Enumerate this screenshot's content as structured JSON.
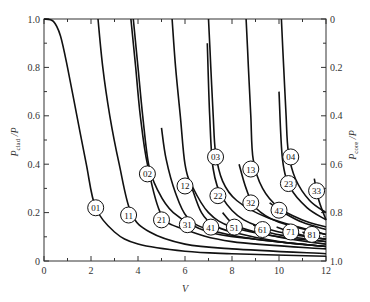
{
  "chart_data": {
    "type": "line",
    "title": "",
    "xlabel": "V",
    "ylabel_left": "P_clad / P",
    "ylabel_right": "P_core / P",
    "xlim": [
      0,
      12
    ],
    "ylim": [
      0,
      1.0
    ],
    "grid": false,
    "legend": "inline circled mode labels",
    "x_ticks": [
      "0",
      "2",
      "4",
      "6",
      "8",
      "10",
      "12"
    ],
    "y_ticks_left": [
      "0",
      "0.2",
      "0.4",
      "0.6",
      "0.8",
      "1.0"
    ],
    "y_ticks_right": [
      "1.0",
      "0.8",
      "0.6",
      "0.4",
      "0.2",
      "0"
    ],
    "series": [
      {
        "name": "01",
        "label_at": [
          2.2,
          0.22
        ],
        "points": [
          [
            0,
            1.0
          ],
          [
            0.4,
            0.99
          ],
          [
            0.7,
            0.93
          ],
          [
            1.0,
            0.8
          ],
          [
            1.4,
            0.6
          ],
          [
            1.8,
            0.4
          ],
          [
            2.2,
            0.22
          ],
          [
            3,
            0.12
          ],
          [
            4,
            0.07
          ],
          [
            6,
            0.04
          ],
          [
            8,
            0.03
          ],
          [
            12,
            0.02
          ]
        ]
      },
      {
        "name": "11",
        "label_at": [
          3.6,
          0.19
        ],
        "points": [
          [
            2.3,
            1.0
          ],
          [
            2.5,
            0.8
          ],
          [
            2.8,
            0.6
          ],
          [
            3.2,
            0.4
          ],
          [
            3.7,
            0.2
          ],
          [
            4.5,
            0.12
          ],
          [
            6,
            0.07
          ],
          [
            8,
            0.05
          ],
          [
            12,
            0.03
          ]
        ]
      },
      {
        "name": "21",
        "label_at": [
          5.0,
          0.17
        ],
        "points": [
          [
            3.7,
            1.0
          ],
          [
            3.9,
            0.8
          ],
          [
            4.1,
            0.6
          ],
          [
            4.4,
            0.4
          ],
          [
            5.0,
            0.19
          ],
          [
            6,
            0.13
          ],
          [
            8,
            0.08
          ],
          [
            12,
            0.05
          ]
        ]
      },
      {
        "name": "02",
        "label_at": [
          4.4,
          0.36
        ],
        "points": [
          [
            3.8,
            1.0
          ],
          [
            4.0,
            0.8
          ],
          [
            4.2,
            0.6
          ],
          [
            4.45,
            0.4
          ],
          [
            4.8,
            0.3
          ],
          [
            5.5,
            0.2
          ],
          [
            7,
            0.12
          ],
          [
            9,
            0.09
          ],
          [
            12,
            0.06
          ]
        ]
      },
      {
        "name": "12",
        "label_at": [
          6.0,
          0.31
        ],
        "points": [
          [
            5.45,
            1.0
          ],
          [
            5.6,
            0.8
          ],
          [
            5.8,
            0.6
          ],
          [
            6.0,
            0.4
          ],
          [
            6.3,
            0.31
          ],
          [
            7,
            0.2
          ],
          [
            8,
            0.14
          ],
          [
            10,
            0.1
          ],
          [
            12,
            0.08
          ]
        ]
      },
      {
        "name": "31",
        "label_at": [
          6.1,
          0.15
        ],
        "points": [
          [
            5.0,
            0.55
          ],
          [
            5.2,
            0.42
          ],
          [
            5.6,
            0.28
          ],
          [
            6.1,
            0.18
          ],
          [
            7,
            0.13
          ],
          [
            9,
            0.09
          ],
          [
            12,
            0.06
          ]
        ]
      },
      {
        "name": "03",
        "label_at": [
          7.3,
          0.43
        ],
        "points": [
          [
            7.0,
            1.0
          ],
          [
            7.1,
            0.8
          ],
          [
            7.2,
            0.6
          ],
          [
            7.3,
            0.45
          ],
          [
            7.6,
            0.33
          ],
          [
            8.2,
            0.25
          ],
          [
            9.5,
            0.18
          ],
          [
            12,
            0.11
          ]
        ]
      },
      {
        "name": "22",
        "label_at": [
          7.4,
          0.27
        ],
        "points": [
          [
            6.95,
            0.9
          ],
          [
            7.05,
            0.6
          ],
          [
            7.2,
            0.38
          ],
          [
            7.6,
            0.26
          ],
          [
            8.5,
            0.17
          ],
          [
            10,
            0.12
          ],
          [
            12,
            0.09
          ]
        ]
      },
      {
        "name": "41",
        "label_at": [
          7.1,
          0.14
        ],
        "points": [
          [
            6.3,
            0.3
          ],
          [
            6.7,
            0.2
          ],
          [
            7.2,
            0.15
          ],
          [
            8,
            0.12
          ],
          [
            10,
            0.08
          ],
          [
            12,
            0.06
          ]
        ]
      },
      {
        "name": "13",
        "label_at": [
          8.8,
          0.38
        ],
        "points": [
          [
            8.6,
            1.0
          ],
          [
            8.7,
            0.8
          ],
          [
            8.8,
            0.6
          ],
          [
            8.9,
            0.42
          ],
          [
            9.3,
            0.3
          ],
          [
            10,
            0.22
          ],
          [
            11,
            0.17
          ],
          [
            12,
            0.14
          ]
        ]
      },
      {
        "name": "32",
        "label_at": [
          8.8,
          0.24
        ],
        "points": [
          [
            8.3,
            0.4
          ],
          [
            8.6,
            0.3
          ],
          [
            9,
            0.22
          ],
          [
            10,
            0.16
          ],
          [
            12,
            0.11
          ]
        ]
      },
      {
        "name": "51",
        "label_at": [
          8.1,
          0.14
        ],
        "points": [
          [
            7.6,
            0.2
          ],
          [
            8.1,
            0.15
          ],
          [
            9,
            0.12
          ],
          [
            10.5,
            0.09
          ],
          [
            12,
            0.07
          ]
        ]
      },
      {
        "name": "04",
        "label_at": [
          10.5,
          0.43
        ],
        "points": [
          [
            10.1,
            1.0
          ],
          [
            10.2,
            0.8
          ],
          [
            10.3,
            0.6
          ],
          [
            10.4,
            0.45
          ],
          [
            10.7,
            0.34
          ],
          [
            11.3,
            0.25
          ],
          [
            12,
            0.2
          ]
        ]
      },
      {
        "name": "23",
        "label_at": [
          10.4,
          0.32
        ],
        "points": [
          [
            10.0,
            0.7
          ],
          [
            10.15,
            0.42
          ],
          [
            10.5,
            0.3
          ],
          [
            11.2,
            0.22
          ],
          [
            12,
            0.17
          ]
        ]
      },
      {
        "name": "42",
        "label_at": [
          10.0,
          0.21
        ],
        "points": [
          [
            9.6,
            0.24
          ],
          [
            10.2,
            0.2
          ],
          [
            11,
            0.16
          ],
          [
            12,
            0.13
          ]
        ]
      },
      {
        "name": "61",
        "label_at": [
          9.3,
          0.13
        ],
        "points": [
          [
            8.9,
            0.15
          ],
          [
            9.5,
            0.12
          ],
          [
            10.5,
            0.1
          ],
          [
            12,
            0.08
          ]
        ]
      },
      {
        "name": "71",
        "label_at": [
          10.5,
          0.12
        ],
        "points": [
          [
            9.9,
            0.14
          ],
          [
            10.5,
            0.12
          ],
          [
            11.3,
            0.1
          ],
          [
            12,
            0.09
          ]
        ]
      },
      {
        "name": "81",
        "label_at": [
          11.4,
          0.11
        ],
        "points": [
          [
            11.0,
            0.12
          ],
          [
            11.4,
            0.1
          ],
          [
            12,
            0.09
          ]
        ]
      },
      {
        "name": "33",
        "label_at": [
          11.6,
          0.29
        ],
        "points": [
          [
            11.5,
            0.34
          ],
          [
            11.7,
            0.25
          ],
          [
            12,
            0.17
          ]
        ]
      }
    ]
  }
}
